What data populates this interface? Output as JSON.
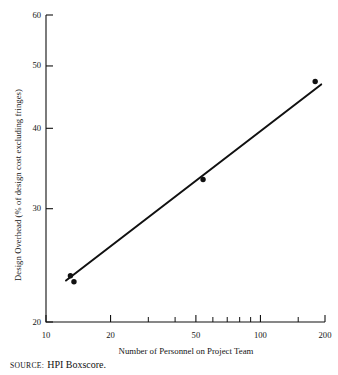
{
  "figure": {
    "source_kicker": "SOURCE:",
    "source_text": "HPI Boxscore."
  },
  "chart_data": {
    "type": "scatter",
    "title": "",
    "subtitle": "",
    "xlabel": "Number of Personnel on Project Team",
    "ylabel": "Design Overhead (% of design cost excluding fringes)",
    "xscale": "log",
    "yscale": "log",
    "xlim": [
      10,
      200
    ],
    "ylim": [
      20,
      60
    ],
    "grid": false,
    "legend": null,
    "legend_position": "none",
    "x_major_ticks": [
      10,
      20,
      50,
      100,
      200
    ],
    "x_tick_labels": [
      "10",
      "20",
      "50",
      "100",
      "200"
    ],
    "x_minor_ticks": [
      30,
      40,
      60,
      70,
      80,
      90,
      150
    ],
    "y_major_ticks": [
      20,
      30,
      40,
      50,
      60
    ],
    "y_tick_labels": [
      "20",
      "30",
      "40",
      "50",
      "60"
    ],
    "series": [
      {
        "name": "Observed projects",
        "marker": "filled-circle",
        "color": "#111111",
        "points": [
          {
            "x": 13,
            "y": 23.6
          },
          {
            "x": 13.5,
            "y": 23.1
          },
          {
            "x": 54,
            "y": 33.3
          },
          {
            "x": 180,
            "y": 47.3
          }
        ]
      },
      {
        "name": "Fitted trend line",
        "type": "line",
        "color": "#111111",
        "points": [
          {
            "x": 12.4,
            "y": 23.2
          },
          {
            "x": 192,
            "y": 46.8
          }
        ]
      }
    ],
    "annotations": []
  }
}
